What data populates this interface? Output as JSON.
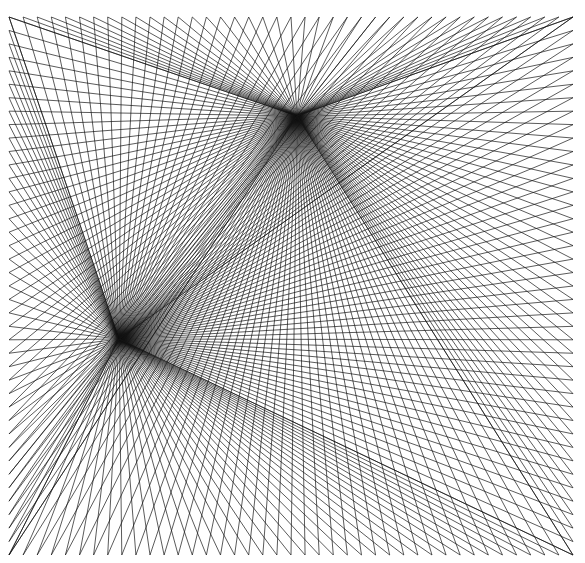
{
  "caption": "",
  "artwork": {
    "background": "#ffffff",
    "stroke": "#141414",
    "stroke_width": 0.7,
    "frame": {
      "left": 9,
      "top": 17,
      "right": 573,
      "bottom": 555
    },
    "hubs": [
      {
        "name": "upper-hub",
        "x": 297,
        "y": 116
      },
      {
        "name": "lower-hub",
        "x": 119,
        "y": 339
      }
    ],
    "points_per_edge": 40
  }
}
